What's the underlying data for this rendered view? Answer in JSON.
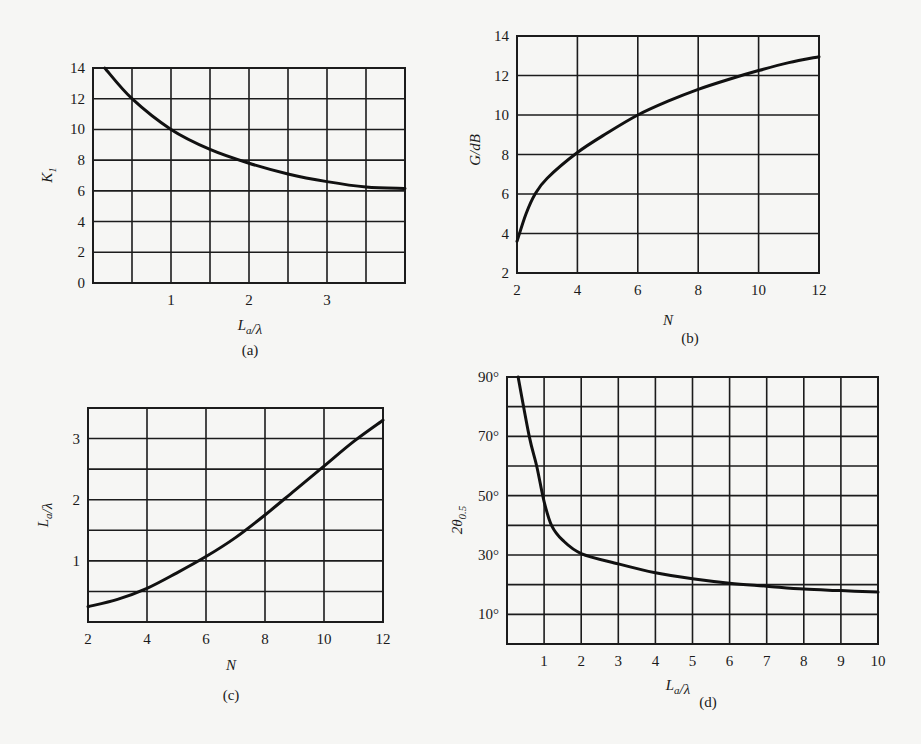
{
  "figure": {
    "panels": [
      {
        "id": "a",
        "caption": "(a)",
        "xlabel": "L_a/λ",
        "ylabel": "K_1"
      },
      {
        "id": "b",
        "caption": "(b)",
        "xlabel": "N",
        "ylabel": "G/dB"
      },
      {
        "id": "c",
        "caption": "(c)",
        "xlabel": "N",
        "ylabel": "L_a/λ"
      },
      {
        "id": "d",
        "caption": "(d)",
        "xlabel": "L_a/λ",
        "ylabel": "2θ_0.5"
      }
    ]
  },
  "chart_data": [
    {
      "panel": "a",
      "type": "line",
      "title": "",
      "xlabel": "La/λ",
      "ylabel": "K1",
      "xlim": [
        0,
        4
      ],
      "ylim": [
        0,
        14
      ],
      "xticks": [
        "1",
        "2",
        "3"
      ],
      "yticks": [
        "0",
        "2",
        "4",
        "6",
        "8",
        "10",
        "12",
        "14"
      ],
      "grid": true,
      "x": [
        0.15,
        0.5,
        1.0,
        1.5,
        2.0,
        2.5,
        3.0,
        3.5,
        4.0
      ],
      "series": [
        {
          "name": "K1",
          "values": [
            14,
            12,
            10,
            8.7,
            7.8,
            7.1,
            6.6,
            6.25,
            6.15
          ]
        }
      ]
    },
    {
      "panel": "b",
      "type": "line",
      "title": "",
      "xlabel": "N",
      "ylabel": "G/dB",
      "xlim": [
        2,
        12
      ],
      "ylim": [
        2,
        14
      ],
      "xticks": [
        "2",
        "4",
        "6",
        "8",
        "10",
        "12"
      ],
      "yticks": [
        "2",
        "4",
        "6",
        "8",
        "10",
        "12",
        "14"
      ],
      "grid": true,
      "x": [
        2,
        2.3,
        2.6,
        3,
        4,
        5,
        6,
        7,
        8,
        9,
        10,
        11,
        12
      ],
      "series": [
        {
          "name": "G",
          "values": [
            3.6,
            5.0,
            6.0,
            6.8,
            8.1,
            9.1,
            10.0,
            10.7,
            11.3,
            11.8,
            12.25,
            12.65,
            12.95
          ]
        }
      ]
    },
    {
      "panel": "c",
      "type": "line",
      "title": "",
      "xlabel": "N",
      "ylabel": "La/λ",
      "xlim": [
        2,
        12
      ],
      "ylim": [
        0,
        3.5
      ],
      "xticks": [
        "2",
        "4",
        "6",
        "8",
        "10",
        "12"
      ],
      "yticks": [
        "1",
        "2",
        "3"
      ],
      "grid": true,
      "x": [
        2,
        3,
        4,
        5,
        6,
        7,
        8,
        9,
        10,
        11,
        12
      ],
      "series": [
        {
          "name": "La/λ",
          "values": [
            0.25,
            0.37,
            0.55,
            0.8,
            1.07,
            1.38,
            1.75,
            2.15,
            2.55,
            2.95,
            3.3
          ]
        }
      ]
    },
    {
      "panel": "d",
      "type": "line",
      "title": "",
      "xlabel": "La/λ",
      "ylabel": "2θ0.5",
      "xlim": [
        0,
        10
      ],
      "ylim": [
        0,
        90
      ],
      "xticks": [
        "1",
        "2",
        "3",
        "4",
        "5",
        "6",
        "7",
        "8",
        "9",
        "10"
      ],
      "yticks": [
        "10°",
        "30°",
        "50°",
        "70°",
        "90°"
      ],
      "grid": true,
      "x": [
        0.3,
        0.6,
        0.8,
        1.0,
        1.2,
        1.5,
        2,
        3,
        4,
        5,
        6,
        7,
        8,
        9,
        10
      ],
      "series": [
        {
          "name": "2θ0.5",
          "values": [
            90,
            70,
            60,
            48,
            40,
            35,
            30.5,
            27,
            24,
            22,
            20.5,
            19.5,
            18.5,
            18,
            17.5
          ]
        }
      ]
    }
  ]
}
